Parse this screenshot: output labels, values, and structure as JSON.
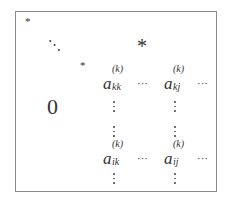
{
  "diagram": {
    "title": "",
    "border_color": "#8a8a8a",
    "upper_left": {
      "diag_first": "*",
      "diag_dots": "⋱",
      "diag_last": "*"
    },
    "upper_right_block": "*",
    "lower_left_block": "0",
    "entries": {
      "kk": {
        "base": "a",
        "sup": "(k)",
        "sub": "kk"
      },
      "kj": {
        "base": "a",
        "sup": "(k)",
        "sub": "kj"
      },
      "ik": {
        "base": "a",
        "sup": "(k)",
        "sub": "ik"
      },
      "ij": {
        "base": "a",
        "sup": "(k)",
        "sub": "ij"
      }
    },
    "hdots": "···"
  }
}
